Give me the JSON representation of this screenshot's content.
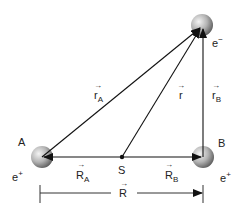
{
  "diagram": {
    "type": "hydrogen-molecule-ion-like vector diagram",
    "colors": {
      "line": "#111111",
      "sphere_light": "#f2f2f2",
      "sphere_dark": "#6e6e6e",
      "text": "#222222"
    },
    "nodes": {
      "electron": {
        "label": "e",
        "charge": "−",
        "x": 202,
        "y": 25
      },
      "proton_a": {
        "name": "A",
        "charge_label": "e",
        "charge": "+",
        "x": 42,
        "y": 157
      },
      "proton_b": {
        "name": "B",
        "charge_label": "e",
        "charge": "+",
        "x": 203,
        "y": 157
      },
      "center_s": {
        "name": "S",
        "x": 122,
        "y": 157
      }
    },
    "vectors": {
      "r_a": {
        "symbol": "r",
        "sub": "A"
      },
      "r": {
        "symbol": "r",
        "sub": ""
      },
      "r_b": {
        "symbol": "r",
        "sub": "B"
      },
      "R_a": {
        "symbol": "R",
        "sub": "A"
      },
      "R_b": {
        "symbol": "R",
        "sub": "B"
      },
      "R": {
        "symbol": "R",
        "sub": ""
      }
    },
    "arrow_glyph": "→"
  }
}
